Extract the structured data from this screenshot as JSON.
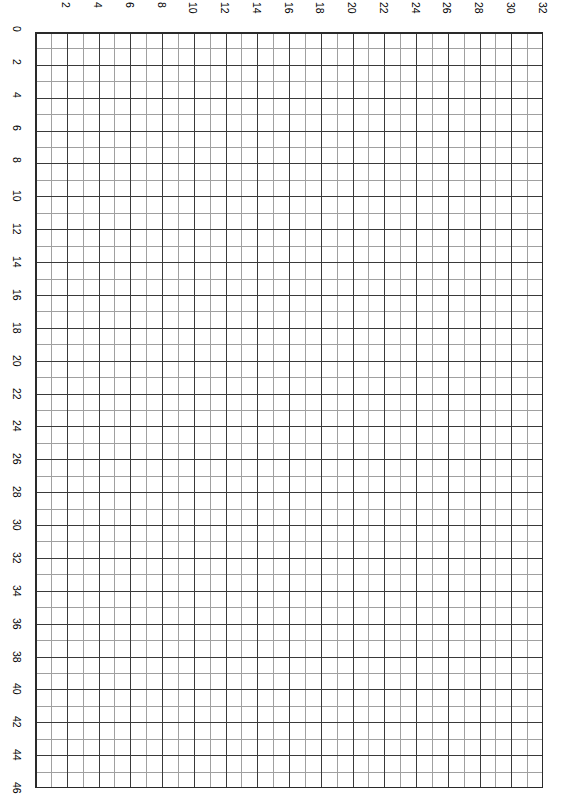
{
  "page": {
    "background_color": "#ffffff"
  },
  "chart_data": {
    "type": "table",
    "title": "",
    "subtitle": "",
    "xlabel": "",
    "ylabel": "",
    "grid": true,
    "legend": null,
    "x_tick_labels": [
      "2",
      "4",
      "6",
      "8",
      "10",
      "12",
      "14",
      "16",
      "18",
      "20",
      "22",
      "24",
      "26",
      "28",
      "30",
      "32"
    ],
    "x_tick_values": [
      2,
      4,
      6,
      8,
      10,
      12,
      14,
      16,
      18,
      20,
      22,
      24,
      26,
      28,
      30,
      32
    ],
    "y_tick_labels": [
      "0",
      "2",
      "4",
      "6",
      "8",
      "10",
      "12",
      "14",
      "16",
      "18",
      "20",
      "22",
      "24",
      "26",
      "28",
      "30",
      "32",
      "34",
      "36",
      "38",
      "40",
      "42",
      "44",
      "46"
    ],
    "y_tick_values": [
      0,
      2,
      4,
      6,
      8,
      10,
      12,
      14,
      16,
      18,
      20,
      22,
      24,
      26,
      28,
      30,
      32,
      34,
      36,
      38,
      40,
      42,
      44,
      46
    ],
    "x_origin_label": "0",
    "xlim": [
      0,
      32
    ],
    "ylim": [
      0,
      46
    ],
    "columns": 32,
    "rows": 46,
    "major_interval": 2,
    "minor_interval": 1,
    "series": [],
    "values": [],
    "categories": []
  },
  "style": {
    "major_line_color": "#3a3a3a",
    "minor_line_color": "#a0a0a0",
    "border_color": "#2a2a2a",
    "label_color": "#000000",
    "cell_fill": "#ffffff"
  },
  "geometry": {
    "grid_left": 35,
    "grid_top": 32,
    "grid_width": 508,
    "grid_height": 756,
    "cell_width": 15.875,
    "cell_height": 16.4348
  }
}
